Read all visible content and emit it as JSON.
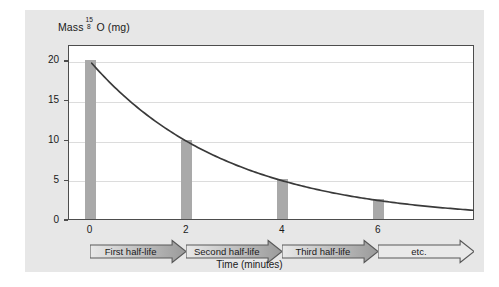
{
  "axes": {
    "y_title_prefix": "Mass",
    "y_title_isotope_sup": "15",
    "y_title_isotope_sub": "8",
    "y_title_suffix": "O (mg)",
    "x_title": "Time (minutes)",
    "y_ticks": [
      "0",
      "5",
      "10",
      "15",
      "20"
    ],
    "x_ticks": [
      "0",
      "2",
      "4",
      "6"
    ]
  },
  "bands": [
    {
      "label": "First half-life"
    },
    {
      "label": "Second half-life"
    },
    {
      "label": "Third half-life"
    },
    {
      "label": "etc."
    }
  ],
  "colors": {
    "panel": "#e7e7e7",
    "plot_bg": "#ffffff",
    "axis": "#4d4d4d",
    "grid": "#dcdcdc",
    "bar": "#a9a9a9",
    "curve": "#3a3a3a",
    "arrow_light": "#e9e9e9",
    "arrow_dark": "#9a9a9a",
    "arrow_outline": "#595959",
    "text": "#1a1a1a"
  },
  "chart_data": {
    "type": "line",
    "title": "",
    "xlabel": "Time (minutes)",
    "ylabel": "Mass 15-8 O (mg)",
    "xlim": [
      -0.45,
      8.0
    ],
    "ylim": [
      0,
      22
    ],
    "grid": true,
    "legend": "none",
    "xticks": [
      0,
      2,
      4,
      6
    ],
    "yticks": [
      0,
      5,
      10,
      15,
      20
    ],
    "series": [
      {
        "name": "Bars (mass at each half-life)",
        "type": "bar",
        "x": [
          0,
          2,
          4,
          6
        ],
        "values": [
          20,
          10,
          5,
          2.5
        ]
      },
      {
        "name": "Exponential decay curve",
        "type": "line",
        "formula": "M = 20 * (0.5)^(t/2)",
        "x": [
          0,
          0.5,
          1,
          1.5,
          2,
          2.5,
          3,
          3.5,
          4,
          4.5,
          5,
          5.5,
          6,
          6.5,
          7,
          7.5,
          8
        ],
        "values": [
          20,
          16.82,
          14.14,
          11.89,
          10,
          8.41,
          7.07,
          5.95,
          5,
          4.2,
          3.54,
          2.97,
          2.5,
          2.1,
          1.77,
          1.49,
          1.25
        ]
      }
    ],
    "annotations": [
      "First half-life",
      "Second half-life",
      "Third half-life",
      "etc."
    ],
    "half_life_minutes": 2,
    "initial_mass_mg": 20
  }
}
